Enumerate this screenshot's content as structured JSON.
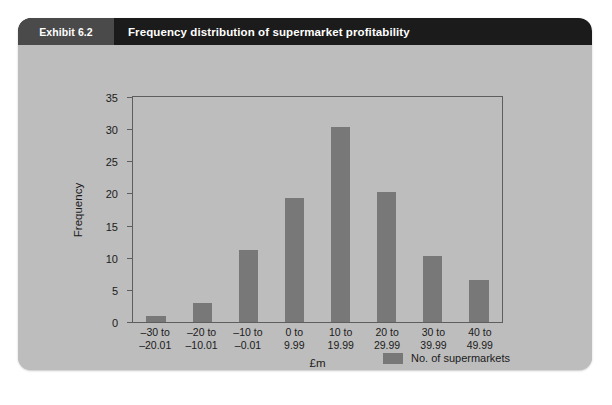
{
  "exhibit": {
    "tag": "Exhibit 6.2",
    "title": "Frequency distribution of supermarket profitability"
  },
  "colors": {
    "title_bar": "#1b1b1b",
    "tag_bg": "#4a4a4a",
    "card_bg": "#bdbdbd",
    "bar": "#787878",
    "axis": "#5e5e5e",
    "text": "#1b1b1b"
  },
  "chart_data": {
    "type": "bar",
    "title": "Frequency distribution of supermarket profitability",
    "xlabel": "£m",
    "ylabel": "Frequency",
    "ylim": [
      0,
      35
    ],
    "yticks": [
      0,
      5,
      10,
      15,
      20,
      25,
      30,
      35
    ],
    "grid": false,
    "legend_position": "bottom-right",
    "categories": [
      "–30 to –20.01",
      "–20 to –10.01",
      "–10 to –0.01",
      "0 to 9.99",
      "10 to 19.99",
      "20 to 29.99",
      "30 to 39.99",
      "40 to 49.99"
    ],
    "category_lines": [
      [
        "–30 to",
        "–20.01"
      ],
      [
        "–20 to",
        "–10.01"
      ],
      [
        "–10 to",
        "–0.01"
      ],
      [
        "0 to",
        "9.99"
      ],
      [
        "10 to",
        "19.99"
      ],
      [
        "20 to",
        "29.99"
      ],
      [
        "30 to",
        "39.99"
      ],
      [
        "40 to",
        "49.99"
      ]
    ],
    "series": [
      {
        "name": "No. of supermarkets",
        "values": [
          1,
          3,
          11.2,
          19.3,
          30.3,
          20.2,
          10.3,
          6.5
        ]
      }
    ]
  }
}
